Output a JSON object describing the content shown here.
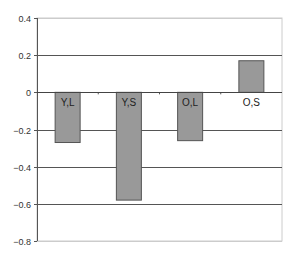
{
  "chart_data": {
    "type": "bar",
    "title": "",
    "xlabel": "",
    "ylabel": "",
    "categories": [
      "Y,L",
      "Y,S",
      "O,L",
      "O,S"
    ],
    "values": [
      -0.27,
      -0.58,
      -0.26,
      0.17
    ],
    "ylim": [
      -0.8,
      0.4
    ],
    "yticks": [
      0.4,
      0.2,
      0,
      -0.2,
      -0.4,
      -0.6,
      -0.8
    ],
    "ytick_labels": [
      "0.4",
      "0.2",
      "0",
      "−0.2",
      "−0.4",
      "−0.6",
      "−0.8"
    ],
    "grid": true,
    "legend": null,
    "colors": {
      "bar": "#999999",
      "bar_stroke": "#555555",
      "grid": "#555555",
      "frame": "#cccccc"
    }
  }
}
